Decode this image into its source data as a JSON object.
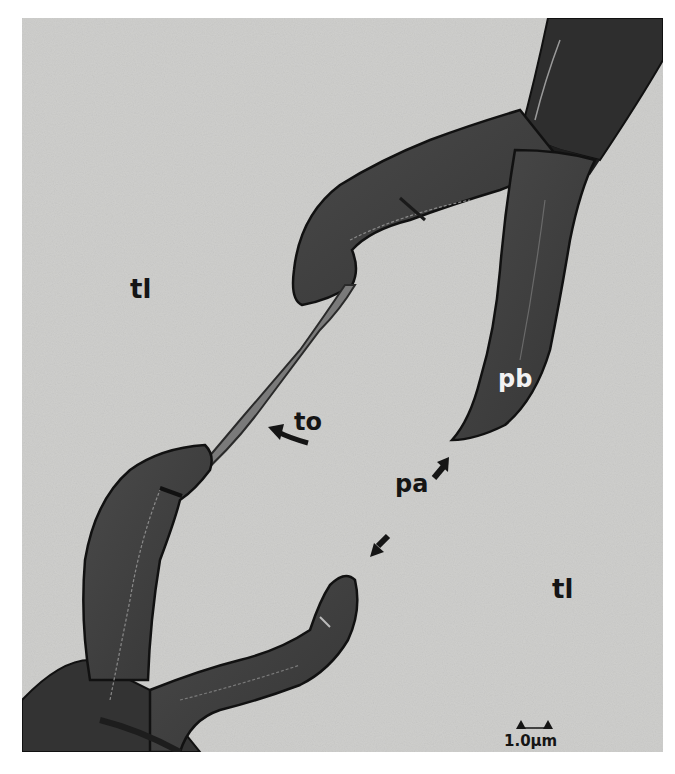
{
  "figure": {
    "type": "electron micrograph",
    "background_color": "#cfcfcd",
    "tissue_color": "#3e3e3e",
    "labels": {
      "tl_upper": "tl",
      "tl_lower": "tl",
      "pb": "pb",
      "to": "to",
      "pa": "pa"
    },
    "scale_bar": {
      "label": "1.0μm"
    }
  }
}
